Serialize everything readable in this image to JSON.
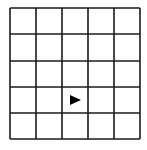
{
  "grid": {
    "rows": 5,
    "cols": 5,
    "x_lines": [
      10,
      36,
      62,
      88,
      114,
      140
    ],
    "y_lines": [
      8,
      34,
      61,
      87,
      113,
      139
    ],
    "line_color": "#1a1a1a",
    "background": "#ffffff"
  },
  "marker": {
    "shape": "arrow-right",
    "row": 4,
    "col": 3,
    "color": "#000000"
  }
}
